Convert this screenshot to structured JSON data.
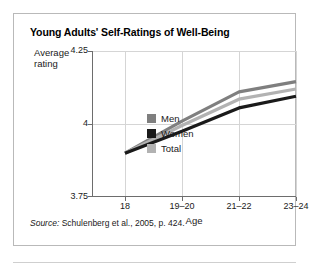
{
  "figure": {
    "title": "Young Adults' Self-Ratings of Well-Being",
    "source_label": "Source:",
    "source_text": " Schulenberg et al., 2005, p. 424."
  },
  "legend": {
    "position": "inside-lower-right",
    "entries": [
      {
        "label": "Men",
        "color": "#7f7f7f",
        "swatch_name": "legend-swatch-men"
      },
      {
        "label": "Women",
        "color": "#1a1a1a",
        "swatch_name": "legend-swatch-women"
      },
      {
        "label": "Total",
        "color": "#b2b2b2",
        "swatch_name": "legend-swatch-total"
      }
    ]
  },
  "axes": {
    "y_title_line1": "Average",
    "y_title_line2": "rating",
    "x_title": "Age",
    "y_ticks": [
      "4.25",
      "4",
      "3.75"
    ],
    "x_ticks": [
      "18",
      "19–20",
      "21–22",
      "23–24"
    ]
  },
  "chart_data": {
    "type": "line",
    "title": "Young Adults' Self-Ratings of Well-Being",
    "xlabel": "Age",
    "ylabel": "Average rating",
    "categories": [
      "18",
      "19–20",
      "21–22",
      "23–24"
    ],
    "series": [
      {
        "name": "Men",
        "color": "#7f7f7f",
        "values": [
          3.9,
          4.01,
          4.11,
          4.145
        ]
      },
      {
        "name": "Women",
        "color": "#1a1a1a",
        "values": [
          3.9,
          3.975,
          4.055,
          4.095
        ]
      },
      {
        "name": "Total",
        "color": "#b2b2b2",
        "values": [
          3.9,
          3.995,
          4.085,
          4.12
        ]
      }
    ],
    "ylim": [
      3.75,
      4.25
    ],
    "ytick_values": [
      4.25,
      4.0,
      3.75
    ],
    "grid": true,
    "legend_position": "inside-lower-right",
    "source": "Source: Schulenberg et al., 2005, p. 424."
  }
}
